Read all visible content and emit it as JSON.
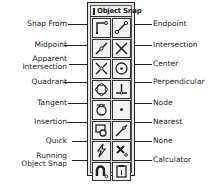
{
  "palette": {
    "title": "Object Snap",
    "buttons": [
      {
        "row": 0,
        "col": 0,
        "name": "snap-from",
        "icon": "snap-from-icon"
      },
      {
        "row": 0,
        "col": 1,
        "name": "endpoint",
        "icon": "endpoint-icon"
      },
      {
        "row": 1,
        "col": 0,
        "name": "midpoint",
        "icon": "midpoint-icon"
      },
      {
        "row": 1,
        "col": 1,
        "name": "intersection",
        "icon": "intersection-icon"
      },
      {
        "row": 2,
        "col": 0,
        "name": "apparent-intersection",
        "icon": "apparent-intersection-icon"
      },
      {
        "row": 2,
        "col": 1,
        "name": "center",
        "icon": "center-icon"
      },
      {
        "row": 3,
        "col": 0,
        "name": "quadrant",
        "icon": "quadrant-icon"
      },
      {
        "row": 3,
        "col": 1,
        "name": "perpendicular",
        "icon": "perpendicular-icon"
      },
      {
        "row": 4,
        "col": 0,
        "name": "tangent",
        "icon": "tangent-icon"
      },
      {
        "row": 4,
        "col": 1,
        "name": "node",
        "icon": "node-icon"
      },
      {
        "row": 5,
        "col": 0,
        "name": "insertion",
        "icon": "insertion-icon"
      },
      {
        "row": 5,
        "col": 1,
        "name": "nearest",
        "icon": "nearest-icon"
      },
      {
        "row": 6,
        "col": 0,
        "name": "quick",
        "icon": "quick-icon"
      },
      {
        "row": 6,
        "col": 1,
        "name": "none",
        "icon": "none-icon"
      },
      {
        "row": 7,
        "col": 0,
        "name": "running-object-snap",
        "icon": "running-object-snap-icon"
      },
      {
        "row": 7,
        "col": 1,
        "name": "calculator",
        "icon": "calculator-icon"
      }
    ]
  },
  "labels": {
    "left": [
      "Snap From",
      "Midpoint",
      "Apparent\nIntersection",
      "Quadrant",
      "Tangent",
      "Insertion",
      "Quick",
      "Running\nObject Snap"
    ],
    "right": [
      "Endpoint",
      "Intersection",
      "Center",
      "Perpendicular",
      "Node",
      "Nearest",
      "None",
      "Calculator"
    ]
  },
  "left_labels": {
    "snap_from": "Snap From",
    "midpoint": "Midpoint",
    "apparent_1": "Apparent",
    "apparent_2": "Intersection",
    "quadrant": "Quadrant",
    "tangent": "Tangent",
    "insertion": "Insertion",
    "quick": "Quick",
    "running_1": "Running",
    "running_2": "Object Snap"
  },
  "right_labels": {
    "endpoint": "Endpoint",
    "intersection": "Intersection",
    "center": "Center",
    "perpendicular": "Perpendicular",
    "node": "Node",
    "nearest": "Nearest",
    "none": "None",
    "calculator": "Calculator"
  }
}
